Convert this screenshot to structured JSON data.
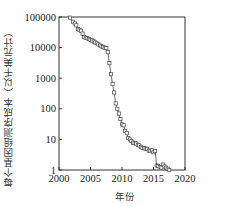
{
  "chart_data": {
    "type": "line",
    "title": "",
    "xlabel": "年份",
    "ylabel": "每个基因组测序成本（以千美元计）",
    "yscale": "log",
    "xlim": [
      2000,
      2020
    ],
    "ylim": [
      1,
      100000
    ],
    "xticks": [
      2000,
      2005,
      2010,
      2015,
      2020
    ],
    "yticks": [
      1,
      10,
      100,
      1000,
      10000,
      100000
    ],
    "ytick_labels": [
      "1",
      "10",
      "100",
      "1000",
      "10000",
      "100000"
    ],
    "grid": false,
    "legend": null,
    "marker": "square-open",
    "series": [
      {
        "name": "每个基因组测序成本",
        "x": [
          2001.75,
          2002.25,
          2002.5,
          2002.75,
          2003.0,
          2003.25,
          2003.5,
          2003.75,
          2004.0,
          2004.25,
          2004.5,
          2004.75,
          2005.0,
          2005.25,
          2005.5,
          2005.75,
          2006.0,
          2006.25,
          2006.5,
          2006.75,
          2007.0,
          2007.25,
          2007.5,
          2007.75,
          2008.0,
          2008.25,
          2008.5,
          2008.75,
          2009.0,
          2009.25,
          2009.5,
          2009.75,
          2010.0,
          2010.25,
          2010.5,
          2010.75,
          2011.0,
          2011.25,
          2011.5,
          2011.75,
          2012.0,
          2012.25,
          2012.5,
          2012.75,
          2013.0,
          2013.25,
          2013.5,
          2013.75,
          2014.0,
          2014.25,
          2014.5,
          2014.75,
          2015.0,
          2015.25,
          2015.5,
          2015.75,
          2016.0,
          2016.25,
          2016.5,
          2016.75,
          2017.0,
          2017.25,
          2017.5
        ],
        "y": [
          95263,
          70175,
          61448,
          53751,
          40157,
          38255,
          35746,
          28780,
          22059,
          20963,
          20083,
          18918,
          18000,
          17000,
          16000,
          14800,
          13800,
          12700,
          11800,
          11000,
          10500,
          9900,
          9600,
          7100,
          3100,
          1350,
          650,
          340,
          150,
          100,
          70,
          46,
          31,
          29,
          19,
          16,
          11,
          10,
          8.8,
          7.8,
          7.7,
          7.3,
          6.6,
          6.3,
          5.7,
          5.3,
          5.1,
          5.0,
          4.9,
          4.3,
          4.1,
          4.4,
          3.8,
          4.2,
          1.4,
          1.36,
          1.25,
          1.2,
          1.5,
          1.3,
          1.2,
          1.1,
          1.0
        ]
      }
    ]
  }
}
